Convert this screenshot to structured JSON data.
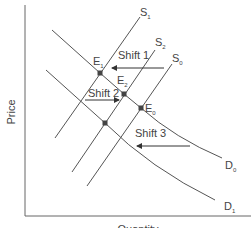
{
  "diagram": {
    "type": "supply-demand",
    "axes": {
      "y_label": "Price",
      "x_label": "Quantity"
    },
    "curves": {
      "S1": {
        "main": "S",
        "sub": "1"
      },
      "S2": {
        "main": "S",
        "sub": "2"
      },
      "S0": {
        "main": "S",
        "sub": "0"
      },
      "D0": {
        "main": "D",
        "sub": "0"
      },
      "D1": {
        "main": "D",
        "sub": "1"
      }
    },
    "points": {
      "E1": {
        "main": "E",
        "sub": "1"
      },
      "E2": {
        "main": "E",
        "sub": "2"
      },
      "E0": {
        "main": "E",
        "sub": "0"
      }
    },
    "shifts": {
      "shift1": "Shift 1",
      "shift2": "Shift 2",
      "shift3": "Shift 3"
    },
    "colors": {
      "curve": "#555555",
      "point": "#444444",
      "text": "#444444"
    }
  }
}
